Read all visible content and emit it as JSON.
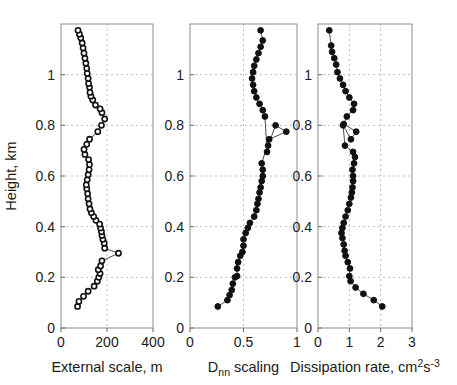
{
  "figure": {
    "width": 457,
    "height": 385,
    "background": "#ffffff",
    "shared_ylabel": "Height, km",
    "marker_color": "#111111",
    "line_color": "#4d4d4d",
    "grid_color": "#bdbdbd",
    "axis_color": "#8c8c8c"
  },
  "chart_data": [
    {
      "type": "line",
      "panel": "left",
      "title": "",
      "xlabel": "External scale, m",
      "ylabel": "Height, km",
      "xlim": [
        0,
        400
      ],
      "ylim": [
        0,
        1.2
      ],
      "xticks": [
        0,
        200,
        400
      ],
      "xticklabels": [
        "0",
        "200",
        "400"
      ],
      "yticks": [
        0,
        0.2,
        0.4,
        0.6,
        0.8,
        1
      ],
      "yticklabels": [
        "0",
        "0.2",
        "0.4",
        "0.6",
        "0.8",
        "1"
      ],
      "grid": true,
      "marker": "open-circle",
      "x": [
        72,
        78,
        98,
        118,
        144,
        158,
        164,
        170,
        162,
        172,
        178,
        250,
        190,
        188,
        182,
        178,
        176,
        172,
        168,
        152,
        142,
        132,
        126,
        122,
        118,
        116,
        112,
        110,
        114,
        118,
        122,
        124,
        120,
        104,
        100,
        112,
        124,
        160,
        176,
        190,
        178,
        170,
        150,
        138,
        130,
        126,
        124,
        120,
        118,
        114,
        112,
        108,
        104,
        100,
        96,
        92,
        86,
        80,
        74
      ],
      "y": [
        0.085,
        0.105,
        0.125,
        0.145,
        0.165,
        0.185,
        0.2,
        0.215,
        0.23,
        0.245,
        0.265,
        0.295,
        0.315,
        0.335,
        0.35,
        0.365,
        0.38,
        0.395,
        0.41,
        0.425,
        0.44,
        0.455,
        0.47,
        0.49,
        0.51,
        0.53,
        0.55,
        0.565,
        0.585,
        0.605,
        0.625,
        0.645,
        0.665,
        0.685,
        0.705,
        0.725,
        0.745,
        0.775,
        0.8,
        0.825,
        0.85,
        0.865,
        0.88,
        0.9,
        0.915,
        0.93,
        0.95,
        0.965,
        0.985,
        1.005,
        1.025,
        1.045,
        1.065,
        1.085,
        1.105,
        1.125,
        1.145,
        1.16,
        1.175
      ]
    },
    {
      "type": "line",
      "panel": "middle",
      "title": "",
      "xlabel": "D_nn scaling",
      "xlabel_parts": {
        "base": "D",
        "sub": "nn",
        "tail": " scaling"
      },
      "ylabel": "Height, km",
      "xlim": [
        0,
        1
      ],
      "ylim": [
        0,
        1.2
      ],
      "xticks": [
        0,
        0.5,
        1
      ],
      "xticklabels": [
        "0",
        "0.5",
        "1"
      ],
      "yticks": [
        0,
        0.2,
        0.4,
        0.6,
        0.8,
        1
      ],
      "yticklabels": [
        "0",
        "0.2",
        "0.4",
        "0.6",
        "0.8",
        "1"
      ],
      "grid": true,
      "marker": "filled-circle",
      "x": [
        0.26,
        0.35,
        0.37,
        0.39,
        0.4,
        0.42,
        0.44,
        0.44,
        0.45,
        0.47,
        0.49,
        0.5,
        0.5,
        0.52,
        0.54,
        0.56,
        0.6,
        0.62,
        0.63,
        0.64,
        0.65,
        0.66,
        0.67,
        0.68,
        0.68,
        0.67,
        0.74,
        0.9,
        0.8,
        0.73,
        0.72,
        0.7,
        0.68,
        0.65,
        0.62,
        0.6,
        0.59,
        0.58,
        0.59,
        0.6,
        0.62,
        0.64,
        0.66,
        0.68,
        0.66
      ],
      "y": [
        0.085,
        0.11,
        0.13,
        0.15,
        0.175,
        0.2,
        0.205,
        0.235,
        0.26,
        0.285,
        0.3,
        0.325,
        0.35,
        0.375,
        0.395,
        0.415,
        0.44,
        0.465,
        0.49,
        0.51,
        0.535,
        0.555,
        0.58,
        0.6,
        0.625,
        0.65,
        0.745,
        0.775,
        0.8,
        0.72,
        0.695,
        0.835,
        0.86,
        0.885,
        0.91,
        0.935,
        0.96,
        0.985,
        1.01,
        1.035,
        1.06,
        1.085,
        1.11,
        1.135,
        1.175
      ]
    },
    {
      "type": "line",
      "panel": "right",
      "title": "",
      "xlabel": "Dissipation rate, cm^2 s^-3",
      "xlabel_parts": {
        "base": "Dissipation rate, cm",
        "sup1": "2",
        "mid": "s",
        "sup2": "-3"
      },
      "ylabel": "Height, km",
      "xlim": [
        0,
        3
      ],
      "ylim": [
        0,
        1.2
      ],
      "xticks": [
        0,
        1,
        2,
        3
      ],
      "xticklabels": [
        "0",
        "1",
        "2",
        "3"
      ],
      "yticks": [
        0,
        0.2,
        0.4,
        0.6,
        0.8,
        1
      ],
      "yticklabels": [
        "0",
        "0.2",
        "0.4",
        "0.6",
        "0.8",
        "1"
      ],
      "grid": true,
      "marker": "filled-circle",
      "x": [
        2.05,
        1.78,
        1.45,
        1.2,
        1.04,
        1.0,
        1.02,
        0.95,
        0.88,
        0.85,
        0.82,
        0.78,
        0.75,
        0.78,
        0.82,
        0.88,
        0.95,
        1.0,
        1.05,
        1.08,
        1.1,
        1.12,
        1.12,
        1.1,
        1.15,
        1.18,
        1.12,
        0.86,
        0.8,
        1.05,
        1.22,
        0.82,
        0.92,
        1.12,
        1.15,
        1.0,
        0.88,
        0.8,
        0.7,
        0.62,
        0.58,
        0.52,
        0.45,
        0.42,
        0.36
      ],
      "y": [
        0.085,
        0.11,
        0.135,
        0.16,
        0.185,
        0.205,
        0.235,
        0.26,
        0.285,
        0.305,
        0.33,
        0.355,
        0.375,
        0.395,
        0.415,
        0.44,
        0.465,
        0.49,
        0.515,
        0.535,
        0.555,
        0.58,
        0.6,
        0.625,
        0.65,
        0.675,
        0.695,
        0.72,
        0.8,
        0.745,
        0.775,
        0.805,
        0.835,
        0.86,
        0.885,
        0.91,
        0.935,
        0.96,
        0.985,
        1.01,
        1.04,
        1.065,
        1.09,
        1.115,
        1.175
      ]
    }
  ]
}
